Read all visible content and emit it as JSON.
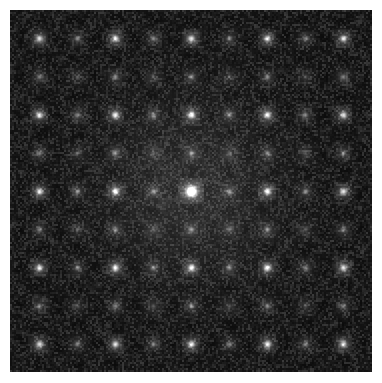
{
  "figure": {
    "caption": "",
    "colormap": "grayscale",
    "background_color": "#ffffff",
    "field_color": "#0c0c0c",
    "peak_color": "#ffffff"
  },
  "canvas": {
    "width": 382,
    "height": 383,
    "margin_left": 10,
    "margin_top": 10,
    "field_width": 362,
    "field_height": 362
  },
  "chart_data": {
    "type": "heatmap",
    "xlabel": "",
    "ylabel": "",
    "grid": false,
    "legend": "none",
    "colormap": "gray",
    "xlim": [
      0,
      362
    ],
    "ylim": [
      0,
      362
    ],
    "center": {
      "x": 181,
      "y": 181,
      "intensity": 255,
      "halo_radius": 26
    },
    "lattice": {
      "spacing_x": 38.0,
      "spacing_y": 38.2,
      "strong_multiple": 2,
      "orders_x": [
        -4,
        -3,
        -2,
        -1,
        0,
        1,
        2,
        3,
        4
      ],
      "orders_y": [
        -4,
        -3,
        -2,
        -1,
        0,
        1,
        2,
        3,
        4
      ]
    },
    "peaks": [
      {
        "order_x": 0,
        "order_y": 0,
        "x": 181,
        "y": 181,
        "intensity": 255,
        "radius": 3.2
      },
      {
        "order_x": -2,
        "order_y": 0,
        "x": 105,
        "y": 181,
        "intensity": 222,
        "radius": 2.4
      },
      {
        "order_x": 2,
        "order_y": 0,
        "x": 257,
        "y": 181,
        "intensity": 222,
        "radius": 2.4
      },
      {
        "order_x": 0,
        "order_y": -2,
        "x": 181,
        "y": 105,
        "intensity": 214,
        "radius": 2.3
      },
      {
        "order_x": 0,
        "order_y": 2,
        "x": 181,
        "y": 257,
        "intensity": 214,
        "radius": 2.3
      },
      {
        "order_x": -4,
        "order_y": -4,
        "x": 29,
        "y": 29,
        "intensity": 230,
        "radius": 2.6
      },
      {
        "order_x": -4,
        "order_y": 0,
        "x": 29,
        "y": 181,
        "intensity": 218,
        "radius": 2.4
      },
      {
        "order_x": 4,
        "order_y": 0,
        "x": 333,
        "y": 181,
        "intensity": 218,
        "radius": 2.4
      },
      {
        "order_x": 0,
        "order_y": -4,
        "x": 181,
        "y": 29,
        "intensity": 218,
        "radius": 2.4
      },
      {
        "order_x": 0,
        "order_y": 4,
        "x": 181,
        "y": 333,
        "intensity": 218,
        "radius": 2.4
      }
    ],
    "noise": {
      "type": "speckle",
      "base_level": 18,
      "amplitude": 42,
      "grain_px": 2
    },
    "halo": {
      "present": true,
      "radius": 60,
      "intensity_falloff": "gaussian"
    }
  },
  "render_seed": 20250614
}
